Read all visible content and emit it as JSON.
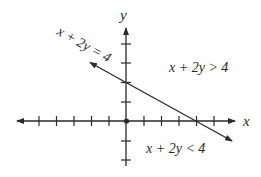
{
  "diagram": {
    "type": "linear-inequality-graph",
    "axes": {
      "x_label": "x",
      "y_label": "y",
      "x_ticks_left": 6,
      "x_ticks_right": 5,
      "y_ticks_above": 4,
      "y_ticks_below": 2
    },
    "boundary_line": {
      "equation_label": "x + 2y = 4",
      "x_intercept": 4,
      "y_intercept": 2
    },
    "regions": {
      "above_label": "x + 2y > 4",
      "below_label": "x + 2y < 4"
    },
    "colors": {
      "ink": "#2a2a2a",
      "background": "#ffffff"
    }
  }
}
